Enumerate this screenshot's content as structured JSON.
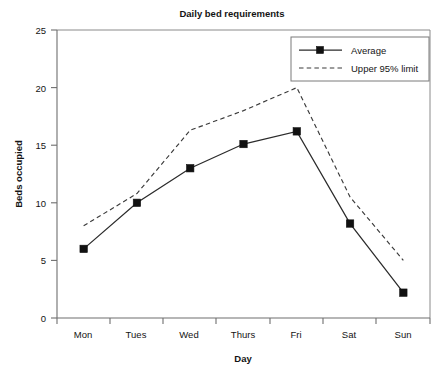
{
  "chart_data": {
    "type": "line",
    "title": "Daily bed requirements",
    "xlabel": "Day",
    "ylabel": "Beds occupied",
    "categories": [
      "Mon",
      "Tues",
      "Wed",
      "Thurs",
      "Fri",
      "Sat",
      "Sun"
    ],
    "series": [
      {
        "name": "Average",
        "values": [
          6,
          10,
          13,
          15.1,
          16.2,
          8.2,
          2.2
        ],
        "style": "solid",
        "marker": "square",
        "color": "#2b2b2b"
      },
      {
        "name": "Upper 95% limit",
        "values": [
          8,
          10.8,
          16.3,
          18,
          20,
          10.5,
          5
        ],
        "style": "dashed",
        "marker": "none",
        "color": "#3a3a3a"
      }
    ],
    "ylim": [
      0,
      25
    ],
    "yticks": [
      0,
      5,
      10,
      15,
      20,
      25
    ],
    "ytick_labels": [
      "0",
      "5",
      "10",
      "15",
      "20",
      "25"
    ],
    "grid": false,
    "legend_position": "top-right",
    "legend_entries": [
      "Average",
      "Upper 95% limit"
    ]
  }
}
